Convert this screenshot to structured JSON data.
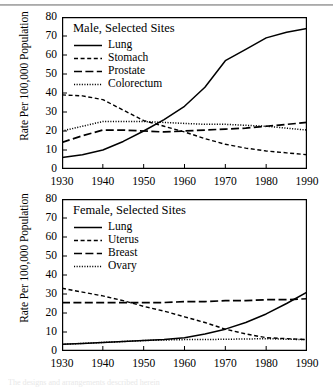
{
  "figure": {
    "top_rule": true,
    "caption_partial": "The designs and arrangements described herein"
  },
  "axis": {
    "ylabel": "Rate Per 100,000 Population",
    "yticks": [
      0,
      10,
      20,
      30,
      40,
      50,
      60,
      70,
      80
    ],
    "xticks": [
      1930,
      1940,
      1950,
      1960,
      1970,
      1980,
      1990
    ],
    "ylim": [
      0,
      80
    ],
    "xlim": [
      1930,
      1990
    ]
  },
  "chart_data": [
    {
      "type": "line",
      "title": "Male, Selected Sites",
      "xlabel": "",
      "ylabel": "Rate Per 100,000 Population",
      "xlim": [
        1930,
        1990
      ],
      "ylim": [
        0,
        80
      ],
      "grid": false,
      "legend_position": "top-left",
      "x": [
        1930,
        1935,
        1940,
        1945,
        1950,
        1955,
        1960,
        1965,
        1970,
        1975,
        1980,
        1985,
        1990
      ],
      "series": [
        {
          "name": "Lung",
          "style": "solid",
          "values": [
            6,
            7.5,
            10,
            14.5,
            20,
            26,
            33,
            43,
            57,
            63,
            69,
            72,
            74
          ]
        },
        {
          "name": "Stomach",
          "style": "dashed-short",
          "values": [
            39,
            38.5,
            36.5,
            31,
            25.5,
            22.5,
            19.5,
            16,
            13,
            11,
            9.5,
            8.5,
            7.5
          ]
        },
        {
          "name": "Prostate",
          "style": "dashed-long",
          "values": [
            14,
            17.5,
            20.5,
            20.5,
            20,
            19.5,
            20,
            20.5,
            21,
            21.5,
            22.5,
            23.5,
            24.5
          ]
        },
        {
          "name": "Colorectum",
          "style": "dotted",
          "values": [
            20,
            22.5,
            25,
            25,
            25,
            24.5,
            24,
            23.5,
            23.5,
            23,
            22.5,
            21.5,
            20.5
          ]
        }
      ]
    },
    {
      "type": "line",
      "title": "Female, Selected Sites",
      "xlabel": "",
      "ylabel": "Rate Per 100,000 Population",
      "xlim": [
        1930,
        1990
      ],
      "ylim": [
        0,
        80
      ],
      "grid": false,
      "legend_position": "top-left",
      "x": [
        1930,
        1935,
        1940,
        1945,
        1950,
        1955,
        1960,
        1965,
        1970,
        1975,
        1980,
        1985,
        1990
      ],
      "series": [
        {
          "name": "Lung",
          "style": "solid",
          "values": [
            3.5,
            4,
            4.5,
            5,
            5.5,
            6,
            7,
            9,
            11.5,
            15,
            19.5,
            25,
            31
          ]
        },
        {
          "name": "Uterus",
          "style": "dashed-short",
          "values": [
            33,
            31,
            29,
            26.5,
            23.5,
            21,
            18,
            15,
            11.5,
            9,
            7,
            6.5,
            6
          ]
        },
        {
          "name": "Breast",
          "style": "dashed-long",
          "values": [
            25.5,
            25.5,
            25.5,
            25.5,
            25.5,
            25.5,
            26,
            26,
            26.5,
            26.5,
            27,
            27,
            27.5
          ]
        },
        {
          "name": "Ovary",
          "style": "dotted",
          "values": [
            3.5,
            4,
            4.5,
            5,
            5.5,
            5.8,
            6,
            6,
            6.2,
            6.3,
            6.5,
            6.2,
            6
          ]
        }
      ]
    }
  ],
  "panels": [
    {
      "id": "male",
      "legend_title": "Male, Selected Sites",
      "legend_items": [
        {
          "label": "Lung",
          "style": "solid"
        },
        {
          "label": "Stomach",
          "style": "dashed-short"
        },
        {
          "label": "Prostate",
          "style": "dashed-long"
        },
        {
          "label": "Colorectum",
          "style": "dotted"
        }
      ]
    },
    {
      "id": "female",
      "legend_title": "Female, Selected Sites",
      "legend_items": [
        {
          "label": "Lung",
          "style": "solid"
        },
        {
          "label": "Uterus",
          "style": "dashed-short"
        },
        {
          "label": "Breast",
          "style": "dashed-long"
        },
        {
          "label": "Ovary",
          "style": "dotted"
        }
      ]
    }
  ]
}
